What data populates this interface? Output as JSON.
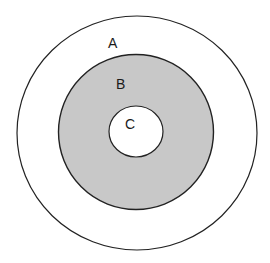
{
  "diagram": {
    "type": "concentric-circles",
    "regions": [
      {
        "id": "A",
        "label": "A",
        "fill": "#ffffff",
        "description": "outer ring"
      },
      {
        "id": "B",
        "label": "B",
        "fill": "#c8c8c8",
        "description": "middle shaded ring"
      },
      {
        "id": "C",
        "label": "C",
        "fill": "#ffffff",
        "description": "inner core"
      }
    ],
    "stroke_color": "#222222",
    "background": "#ffffff"
  }
}
